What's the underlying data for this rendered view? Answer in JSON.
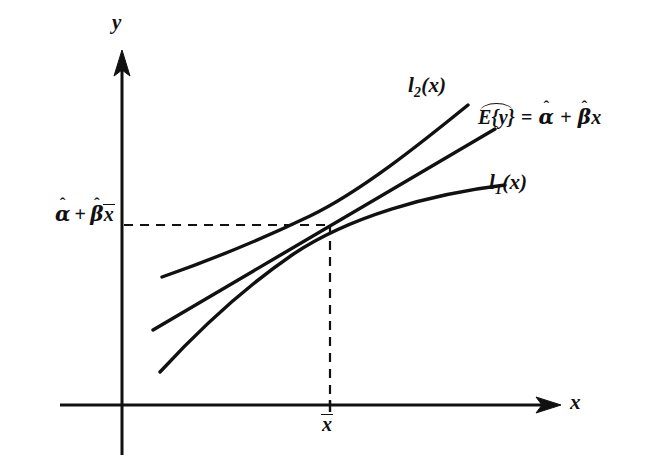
{
  "figure": {
    "type": "line-diagram",
    "title": "",
    "background_color": "#ffffff",
    "ink_color": "#111111"
  },
  "axes": {
    "x_axis": {
      "label": "x",
      "arrow": "right",
      "y_px": 405,
      "x_start_px": 60,
      "x_end_px": 560
    },
    "y_axis": {
      "label": "y",
      "arrow": "up",
      "x_px": 122,
      "y_top_px": 52,
      "y_bottom_px": 455
    },
    "origin_px": [
      122,
      405
    ]
  },
  "ticks": {
    "x": [
      {
        "label": "x̄",
        "label_plain": "x-bar",
        "x_px": 330,
        "mark": true
      }
    ],
    "y": [
      {
        "label": "α̂ + β̂x̄",
        "label_plain": "alpha-hat + beta-hat x-bar",
        "y_px": 225,
        "mark": false
      }
    ]
  },
  "guides": {
    "horizontal_dashed": {
      "name": "horizontal-guide",
      "y_px": 225,
      "x_from_px": 122,
      "x_to_px": 331,
      "dash": "9 7"
    },
    "vertical_dashed": {
      "name": "vertical-guide",
      "x_px": 330,
      "y_from_px": 225,
      "y_to_px": 405,
      "dash": "9 7"
    }
  },
  "labels": {
    "y_axis_letter": "y",
    "x_axis_letter": "x",
    "upper_curve": {
      "base": "l",
      "subscript": "2",
      "arg": "(x)",
      "full": "l₂(x)"
    },
    "lower_curve": {
      "base": "l",
      "subscript": "1",
      "arg": "(x)",
      "full": "l₁(x)"
    },
    "x_mean": "x̄",
    "y_value": "α̂ + β̂x̄",
    "equation": {
      "lhs_letter": "E",
      "lhs_open": "{",
      "lhs_var": "y",
      "lhs_close": "}",
      "lhs_has_widehat": true,
      "equals": "=",
      "alpha": "α",
      "alpha_hat": "ˆ",
      "plus": "+",
      "beta": "β",
      "beta_hat": "ˆ",
      "x_var": "x",
      "full": "E{y}̂ = α̂ + β̂x"
    }
  },
  "curves": [
    {
      "name": "upper-confidence-curve",
      "id": "l2",
      "label": "l₂(x)",
      "stroke_width": 3.4,
      "shape": "concave-up",
      "path": "M 162 277 C 205 262, 260 240, 310 216 C 360 192, 420 144, 468 105"
    },
    {
      "name": "fitted-regression-line",
      "id": "Ey",
      "label": "E{y} = α̂ + β̂x",
      "stroke_width": 3.4,
      "shape": "straight",
      "path": "M 153 330 L 495 129"
    },
    {
      "name": "lower-confidence-curve",
      "id": "l1",
      "label": "l₁(x)",
      "stroke_width": 3.4,
      "shape": "concave-down",
      "path": "M 160 372 C 196 333, 238 292, 292 255 C 348 217, 430 194, 505 185"
    }
  ]
}
